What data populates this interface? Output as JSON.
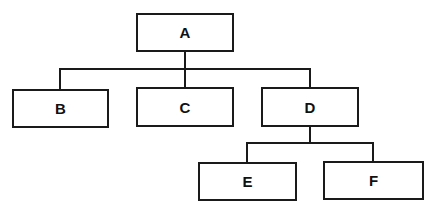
{
  "diagram": {
    "type": "hierarchy-tree",
    "nodes": [
      {
        "id": "A",
        "label": "A",
        "parent": null
      },
      {
        "id": "B",
        "label": "B",
        "parent": "A"
      },
      {
        "id": "C",
        "label": "C",
        "parent": "A"
      },
      {
        "id": "D",
        "label": "D",
        "parent": "A"
      },
      {
        "id": "E",
        "label": "E",
        "parent": "D"
      },
      {
        "id": "F",
        "label": "F",
        "parent": "D"
      }
    ],
    "edges": [
      {
        "from": "A",
        "to": "B"
      },
      {
        "from": "A",
        "to": "C"
      },
      {
        "from": "A",
        "to": "D"
      },
      {
        "from": "D",
        "to": "E"
      },
      {
        "from": "D",
        "to": "F"
      }
    ],
    "colors": {
      "stroke": "#1a1a1a",
      "background": "#ffffff",
      "text": "#111111"
    }
  }
}
